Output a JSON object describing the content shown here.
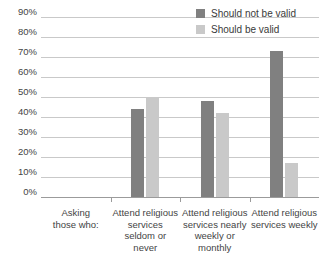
{
  "chart_data": {
    "type": "bar",
    "title": "",
    "xlabel": "",
    "ylabel": "",
    "ylim": [
      0,
      90
    ],
    "grid": true,
    "legend_position": "top-right",
    "categories": [
      "Attend religious services seldom or never",
      "Attend religious services nearly weekly or monthly",
      "Attend religious services weekly"
    ],
    "axis_prefix_label": "Asking those who:",
    "tick_labels": [
      "0%",
      "10%",
      "20%",
      "30%",
      "40%",
      "50%",
      "60%",
      "70%",
      "80%",
      "90%"
    ],
    "tick_values": [
      0,
      10,
      20,
      30,
      40,
      50,
      60,
      70,
      80,
      90
    ],
    "series": [
      {
        "name": "Should not be valid",
        "color": "#808080",
        "values": [
          44,
          48,
          73
        ]
      },
      {
        "name": "Should be valid",
        "color": "#c9c9c9",
        "values": [
          50,
          42,
          17
        ]
      }
    ]
  },
  "legend": {
    "items": [
      {
        "label": "Should not be valid",
        "color": "#808080"
      },
      {
        "label": "Should be valid",
        "color": "#c9c9c9"
      }
    ]
  },
  "x_axis": {
    "labels": [
      "Asking\nthose who:",
      "Attend religious\nservices seldom or\nnever",
      "Attend religious\nservices nearly\nweekly or monthly",
      "Attend religious\nservices weekly"
    ]
  }
}
